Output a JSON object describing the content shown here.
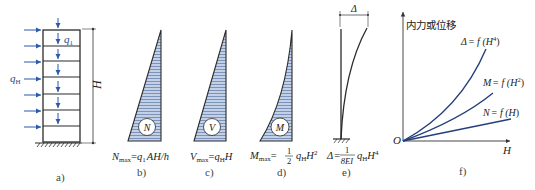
{
  "figure": {
    "panels": [
      {
        "id": "a",
        "caption": "a)",
        "description": "Multi-storey frame under vertical floor load q1 and horizontal distributed load qH",
        "labels": {
          "vertical_load": "q",
          "vertical_load_sub": "1",
          "horizontal_load": "q",
          "horizontal_load_sub": "H",
          "height": "H"
        }
      },
      {
        "id": "b",
        "caption": "b)",
        "diagram_label": "N",
        "formula": {
          "lhs": "N",
          "lhs_sub": "max",
          "eq": "=",
          "rhs_main": "q",
          "rhs_sub": "1",
          "rhs_rest": "AH/h"
        }
      },
      {
        "id": "c",
        "caption": "c)",
        "diagram_label": "V",
        "formula": {
          "lhs": "V",
          "lhs_sub": "max",
          "eq": "=",
          "rhs_main": "q",
          "rhs_sub": "H",
          "rhs_rest": "H"
        }
      },
      {
        "id": "d",
        "caption": "d)",
        "diagram_label": "M",
        "formula": {
          "lhs": "M",
          "lhs_sub": "max",
          "eq": "=",
          "frac_num": "1",
          "frac_den": "2",
          "rhs_main": "q",
          "rhs_sub": "H",
          "rhs_rest": "H",
          "rhs_sup": "2"
        }
      },
      {
        "id": "e",
        "caption": "e)",
        "delta_label": "Δ",
        "formula": {
          "lhs": "Δ",
          "eq": "=",
          "frac_num": "1",
          "frac_den": "8EI",
          "rhs_main": "q",
          "rhs_sub": "H",
          "rhs_rest": "H",
          "rhs_sup": "4"
        }
      },
      {
        "id": "f",
        "caption": "f)",
        "y_axis_label": "内力或位移",
        "x_axis_label": "H",
        "origin_label": "O",
        "curves": [
          {
            "name": "Δ",
            "label_lhs": "Δ",
            "label_rest": "= f (H",
            "label_sup": "4",
            "label_close": ")",
            "exponent": 4
          },
          {
            "name": "M",
            "label_lhs": "M",
            "label_rest": "= f (H",
            "label_sup": "2",
            "label_close": ")",
            "exponent": 2
          },
          {
            "name": "N",
            "label_lhs": "N",
            "label_rest": "= f (H",
            "label_sup": "",
            "label_close": ")",
            "exponent": 1
          }
        ]
      }
    ],
    "colors": {
      "line": "#2b2b2b",
      "fill": "#b9c8e0",
      "hatch": "#4a6aa0",
      "load_arrow": "#2a5aa8",
      "curve": "#24407a"
    }
  }
}
